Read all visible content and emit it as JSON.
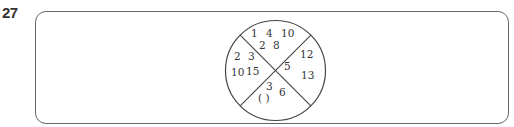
{
  "question": {
    "number": "27"
  },
  "figure": {
    "type": "circle divided into four sectors by two diagonals",
    "sectors": {
      "top": [
        "1",
        "4",
        "10",
        "2",
        "8"
      ],
      "left": [
        "2",
        "3",
        "10",
        "15"
      ],
      "right": [
        "12",
        "5",
        "13"
      ],
      "bottom": [
        "3",
        "6",
        "( )"
      ]
    },
    "labels": {
      "top_1": "1",
      "top_2": "4",
      "top_3": "10",
      "top_4": "2",
      "top_5": "8",
      "left_1": "2",
      "left_2": "3",
      "left_3": "10",
      "left_4": "15",
      "right_1": "12",
      "right_2": "5",
      "right_3": "13",
      "bottom_1": "3",
      "bottom_2": "6",
      "bottom_blank": "(  )"
    }
  }
}
